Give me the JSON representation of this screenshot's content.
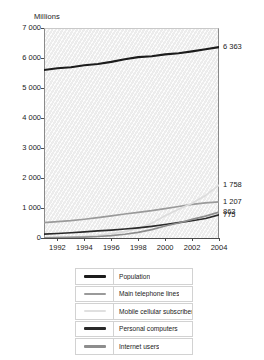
{
  "chart_data": {
    "type": "line",
    "title": "",
    "ylabel": "Millions",
    "xlabel": "",
    "grid": false,
    "legend_position": "bottom",
    "ylim": [
      0,
      7000
    ],
    "xlim": [
      1991,
      2004
    ],
    "yticks": [
      "0",
      "1 000",
      "2 000",
      "3 000",
      "4 000",
      "5 000",
      "6 000",
      "7 000"
    ],
    "ytick_values": [
      0,
      1000,
      2000,
      3000,
      4000,
      5000,
      6000,
      7000
    ],
    "xticks": [
      "1992",
      "1994",
      "1996",
      "1998",
      "2000",
      "2002",
      "2004"
    ],
    "xtick_values": [
      1992,
      1994,
      1996,
      1998,
      2000,
      2002,
      2004
    ],
    "x": [
      1991,
      1992,
      1993,
      1994,
      1995,
      1996,
      1997,
      1998,
      1999,
      2000,
      2001,
      2002,
      2003,
      2004
    ],
    "series": [
      {
        "name": "Population",
        "color": "#1c1c1c",
        "width": 2.1,
        "end_value": 6363,
        "end_label": "6 363",
        "values": [
          5600,
          5660,
          5690,
          5760,
          5800,
          5870,
          5960,
          6030,
          6060,
          6120,
          6160,
          6220,
          6290,
          6363
        ]
      },
      {
        "name": "Main telephone lines",
        "color": "#9a9a9a",
        "width": 1.7,
        "end_value": 1207,
        "end_label": "1 207",
        "values": [
          510,
          545,
          580,
          625,
          680,
          740,
          800,
          855,
          910,
          980,
          1050,
          1120,
          1170,
          1207
        ]
      },
      {
        "name": "Mobile cellular subscribers",
        "color": "#dcdcdc",
        "width": 1.7,
        "end_value": 1758,
        "end_label": "1 758",
        "values": [
          16,
          23,
          34,
          55,
          91,
          145,
          215,
          318,
          490,
          740,
          960,
          1160,
          1420,
          1758
        ]
      },
      {
        "name": "Personal computers",
        "color": "#2a2a2a",
        "width": 1.7,
        "end_value": 775,
        "end_label": "775",
        "values": [
          130,
          150,
          175,
          205,
          235,
          265,
          300,
          340,
          390,
          450,
          510,
          575,
          650,
          775
        ]
      },
      {
        "name": "Internet users",
        "color": "#8d8d8d",
        "width": 1.7,
        "end_value": 863,
        "end_label": "863",
        "values": [
          5,
          10,
          18,
          30,
          50,
          80,
          125,
          190,
          280,
          400,
          500,
          620,
          730,
          863
        ]
      }
    ],
    "end_labels": [
      {
        "text": "6 363",
        "value": 6363
      },
      {
        "text": "1 758",
        "value": 1758
      },
      {
        "text": "1 207",
        "value": 1207
      },
      {
        "text": "863",
        "value": 863
      },
      {
        "text": "775",
        "value": 775
      }
    ],
    "legend": [
      {
        "label": "Population",
        "color": "#1c1c1c",
        "thickness": 3.4
      },
      {
        "label": "Main telephone lines",
        "color": "#9a9a9a",
        "thickness": 2.2
      },
      {
        "label": "Mobile cellular subscribers",
        "color": "#e0e0e0",
        "thickness": 2.2
      },
      {
        "label": "Personal computers",
        "color": "#2a2a2a",
        "thickness": 3.0
      },
      {
        "label": "Internet users",
        "color": "#8d8d8d",
        "thickness": 2.6
      }
    ]
  }
}
